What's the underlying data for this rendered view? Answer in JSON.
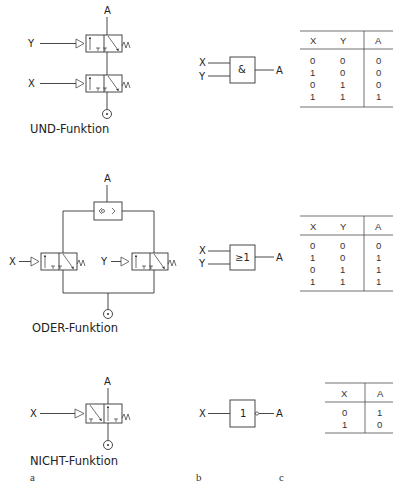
{
  "panels": {
    "a": {
      "label": "a",
      "and": {
        "title": "UND-Funktion",
        "output": "A",
        "inputs": [
          "Y",
          "X"
        ]
      },
      "or": {
        "title": "ODER-Funktion",
        "output": "A",
        "inputs": [
          "X",
          "Y"
        ]
      },
      "not": {
        "title": "NICHT-Funktion",
        "output": "A",
        "inputs": [
          "X"
        ]
      }
    },
    "b": {
      "label": "b",
      "and": {
        "symbol": "&",
        "inputs": [
          "X",
          "Y"
        ],
        "output": "A"
      },
      "or": {
        "symbol": "≥1",
        "inputs": [
          "X",
          "Y"
        ],
        "output": "A"
      },
      "not": {
        "symbol": "1",
        "inputs": [
          "X"
        ],
        "output": "A"
      }
    },
    "c": {
      "label": "c",
      "and_table": {
        "headers": [
          "X",
          "Y",
          "A"
        ],
        "rows": [
          [
            "0",
            "0",
            "0"
          ],
          [
            "1",
            "0",
            "0"
          ],
          [
            "0",
            "1",
            "0"
          ],
          [
            "1",
            "1",
            "1"
          ]
        ]
      },
      "or_table": {
        "headers": [
          "X",
          "Y",
          "A"
        ],
        "rows": [
          [
            "0",
            "0",
            "0"
          ],
          [
            "1",
            "0",
            "1"
          ],
          [
            "0",
            "1",
            "1"
          ],
          [
            "1",
            "1",
            "1"
          ]
        ]
      },
      "not_table": {
        "headers": [
          "X",
          "A"
        ],
        "rows": [
          [
            "0",
            "1"
          ],
          [
            "1",
            "0"
          ]
        ]
      }
    }
  }
}
